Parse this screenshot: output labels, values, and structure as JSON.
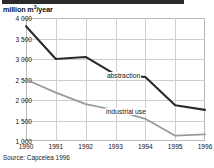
{
  "figure": {
    "unit_label_prefix": "million m",
    "unit_label_sup": "3",
    "unit_label_suffix": "/year",
    "source_note": "Source: Capcelea 1996"
  },
  "chart_data": {
    "type": "line",
    "title": "",
    "subtitle": "",
    "xlabel": "",
    "ylabel": "million m3/year",
    "categories": [
      "1990",
      "1991",
      "1992",
      "1993",
      "1994",
      "1995",
      "1996"
    ],
    "x": [
      1990,
      1991,
      1992,
      1993,
      1994,
      1995,
      1996
    ],
    "series": [
      {
        "name": "abstraction",
        "color": "#2a2a2a",
        "values": [
          3800,
          3000,
          3050,
          2620,
          2560,
          1870,
          1760
        ]
      },
      {
        "name": "industrial use",
        "color": "#9a9a9a",
        "values": [
          2500,
          2180,
          1900,
          1750,
          1540,
          1130,
          1160
        ]
      }
    ],
    "ylim": [
      1000,
      4000
    ],
    "yticks": [
      1000,
      1500,
      2000,
      2500,
      3000,
      3500,
      4000
    ],
    "ytick_labels": [
      "1 000",
      "1 500",
      "2 000",
      "2 500",
      "3 000",
      "3 500",
      "4 000"
    ],
    "xtick_labels": [
      "1990",
      "1991",
      "1992",
      "1993",
      "1994",
      "1995",
      "1996"
    ],
    "grid": true,
    "legend": "inline-annotations",
    "annotations": [
      {
        "text": "abstraction",
        "series": "abstraction"
      },
      {
        "text": "industrial use",
        "series": "industrial use"
      }
    ]
  }
}
